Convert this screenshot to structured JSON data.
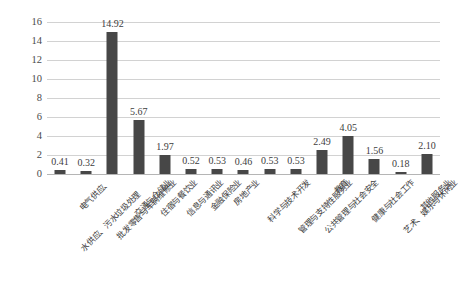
{
  "chart_data": {
    "type": "bar",
    "title": "",
    "subtitle": "",
    "xlabel": "",
    "ylabel": "",
    "ylim": [
      0,
      16
    ],
    "ytick_labels": [
      "0",
      "2",
      "4",
      "6",
      "8",
      "10",
      "12",
      "14",
      "16"
    ],
    "yticks": [
      0,
      2,
      4,
      6,
      8,
      10,
      12,
      14,
      16
    ],
    "grid": true,
    "legend": false,
    "bar_color": "#474747",
    "gridline_color": "#d2d2d2",
    "categories": [
      "电气供应、水供应、污水垃圾处理",
      "批发零售与车辆维修业",
      "交通与仓储业",
      "住宿与餐饮业",
      "信息与通讯业",
      "金融保险业",
      "房地产业",
      "科学与技术开发",
      "管理与支持性服务业",
      "公共管理与社会安全",
      "教育",
      "健康与社会工作",
      "艺术、娱乐与休闲业",
      "其他服务业"
    ],
    "values": [
      0.41,
      0.32,
      14.92,
      5.67,
      1.97,
      0.52,
      0.53,
      0.46,
      0.53,
      0.53,
      2.49,
      4.05,
      1.56,
      0.18
    ],
    "data_labels": [
      "0.41",
      "0.32",
      "14.92",
      "5.67",
      "1.97",
      "0.52",
      "0.53",
      "0.46",
      "0.53",
      "0.53",
      "2.49",
      "4.05",
      "1.56",
      "0.18"
    ],
    "note_last_bar": "2.10"
  },
  "xlabels": {
    "line1": [
      "电气供应、",
      "批发零售与车辆维修业",
      "交通与仓储业",
      "住宿与餐饮业",
      "信息与通讯业",
      "金融保险业",
      "房地产业",
      "科学与技术开发",
      "管理与支持性服务业",
      "公共管理与社会安全",
      "教育",
      "健康与社会工作",
      "艺术、娱乐与休闲业",
      "其他服务业"
    ],
    "line2": [
      "水供应、污水垃圾处理",
      "",
      "",
      "",
      "",
      "",
      "",
      "",
      "",
      "",
      "",
      "",
      "",
      ""
    ]
  },
  "bars": [
    {
      "label": "0.41",
      "value": 0.41,
      "category": "电气供应、水供应、污水垃圾处理"
    },
    {
      "label": "0.32",
      "value": 0.32,
      "category": "批发零售与车辆维修业"
    },
    {
      "label": "14.92",
      "value": 14.92,
      "category": "交通与仓储业"
    },
    {
      "label": "5.67",
      "value": 5.67,
      "category": "住宿与餐饮业"
    },
    {
      "label": "1.97",
      "value": 1.97,
      "category": "信息与通讯业"
    },
    {
      "label": "0.52",
      "value": 0.52,
      "category": "金融保险业"
    },
    {
      "label": "0.53",
      "value": 0.53,
      "category": "房地产业"
    },
    {
      "label": "0.46",
      "value": 0.46,
      "category": "科学与技术开发"
    },
    {
      "label": "0.53",
      "value": 0.53,
      "category": "管理与支持性服务业"
    },
    {
      "label": "0.53",
      "value": 0.53,
      "category": "公共管理与社会安全"
    },
    {
      "label": "2.49",
      "value": 2.49,
      "category": "教育"
    },
    {
      "label": "4.05",
      "value": 4.05,
      "category": "健康与社会工作"
    },
    {
      "label": "1.56",
      "value": 1.56,
      "category": "艺术、娱乐与休闲业"
    },
    {
      "label": "0.18",
      "value": 0.18,
      "category": "其他服务业"
    },
    {
      "label": "2.10",
      "value": 2.1,
      "category": "其他服务业"
    }
  ]
}
